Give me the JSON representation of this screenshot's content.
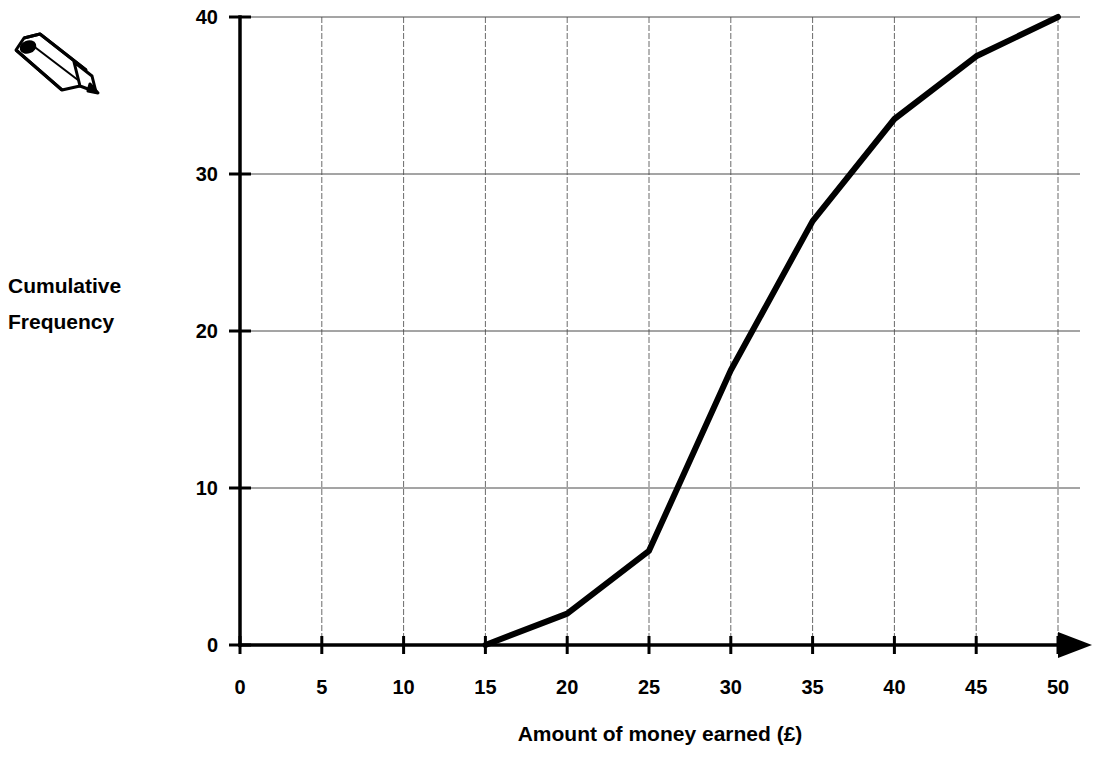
{
  "chart_data": {
    "type": "line",
    "title": "",
    "xlabel": "Amount of money earned (£)",
    "ylabel": "Cumulative Frequency",
    "ylabel_line1": "Cumulative",
    "ylabel_line2": "Frequency",
    "xlim": [
      0,
      50
    ],
    "ylim": [
      0,
      40
    ],
    "xticks": [
      0,
      5,
      10,
      15,
      20,
      25,
      30,
      35,
      40,
      45,
      50
    ],
    "xtick_labels": [
      "0",
      "5",
      "10",
      "15",
      "20",
      "25",
      "30",
      "35",
      "40",
      "45",
      "50"
    ],
    "yticks": [
      0,
      10,
      20,
      30,
      40
    ],
    "ytick_labels": [
      "0",
      "10",
      "20",
      "30",
      "40"
    ],
    "grid": true,
    "legend": "none",
    "series": [
      {
        "name": "Cumulative Frequency",
        "x": [
          15,
          20,
          25,
          30,
          35,
          40,
          45,
          50
        ],
        "values": [
          0,
          2,
          6,
          17.5,
          27,
          33.5,
          37.5,
          40
        ]
      }
    ],
    "line_color": "#000000",
    "grid_color": "#4a4a4a",
    "axis_color": "#000000",
    "background_color": "#ffffff"
  },
  "decorations": {
    "pencil_icon_name": "pencil-icon"
  }
}
